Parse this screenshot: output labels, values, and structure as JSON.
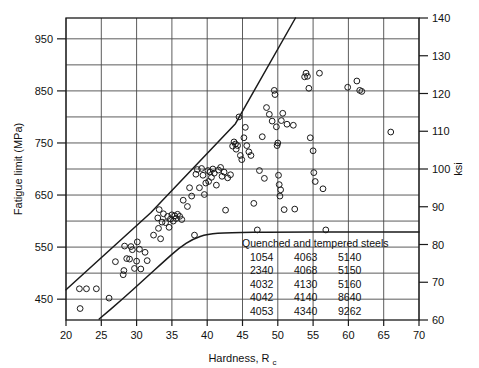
{
  "chart_data": {
    "type": "scatter",
    "title": "",
    "xlabel": "Hardness, Rc",
    "xlabel_main": "Hardness, R",
    "xlabel_sub": "c",
    "ylabel": "Fatigue limit (MPa)",
    "ylabel_right": "ksi",
    "xlim": [
      20,
      70
    ],
    "ylim": [
      410,
      990
    ],
    "ylim_right": [
      60,
      140
    ],
    "grid": true,
    "legend_position": "inside-lower-right",
    "xticks": [
      20,
      25,
      30,
      35,
      40,
      45,
      50,
      55,
      60,
      65,
      70
    ],
    "xtick_labels": [
      "20",
      "25",
      "30",
      "35",
      "40",
      "45",
      "50",
      "55",
      "60",
      "65",
      "70"
    ],
    "yticks": [
      450,
      550,
      650,
      750,
      850,
      950
    ],
    "ytick_labels": [
      "450",
      "550",
      "650",
      "750",
      "850",
      "950"
    ],
    "y_gridlines_mpa": [
      450,
      500,
      550,
      600,
      650,
      700,
      750,
      800,
      850,
      900,
      950
    ],
    "yticks_right": [
      60,
      70,
      80,
      90,
      100,
      110,
      120,
      130,
      140
    ],
    "ytick_labels_right": [
      "60",
      "70",
      "80",
      "90",
      "100",
      "110",
      "120",
      "130",
      "140"
    ],
    "series": [
      {
        "name": "Quenched and tempered steels",
        "marker": "open-circle",
        "color": "#1a1a1a",
        "points": [
          [
            22.0,
            432
          ],
          [
            21.9,
            470
          ],
          [
            22.9,
            470
          ],
          [
            24.3,
            470
          ],
          [
            26.1,
            452
          ],
          [
            27.0,
            522
          ],
          [
            28.1,
            497
          ],
          [
            28.2,
            505
          ],
          [
            28.3,
            552
          ],
          [
            28.6,
            528
          ],
          [
            29.0,
            527
          ],
          [
            29.2,
            551
          ],
          [
            29.4,
            545
          ],
          [
            29.7,
            509
          ],
          [
            30.0,
            523
          ],
          [
            30.1,
            560
          ],
          [
            30.4,
            546
          ],
          [
            30.6,
            508
          ],
          [
            31.2,
            540
          ],
          [
            31.5,
            524
          ],
          [
            32.4,
            573
          ],
          [
            33.0,
            606
          ],
          [
            33.1,
            586
          ],
          [
            33.2,
            622
          ],
          [
            33.4,
            566
          ],
          [
            33.6,
            598
          ],
          [
            33.8,
            614
          ],
          [
            34.1,
            597
          ],
          [
            34.4,
            609
          ],
          [
            34.6,
            588
          ],
          [
            34.8,
            604
          ],
          [
            35.0,
            612
          ],
          [
            35.2,
            600
          ],
          [
            35.4,
            610
          ],
          [
            35.6,
            605
          ],
          [
            35.8,
            613
          ],
          [
            36.1,
            609
          ],
          [
            36.4,
            603
          ],
          [
            36.6,
            640
          ],
          [
            37.2,
            628
          ],
          [
            37.5,
            664
          ],
          [
            37.8,
            648
          ],
          [
            38.2,
            573
          ],
          [
            38.4,
            690
          ],
          [
            38.6,
            699
          ],
          [
            38.9,
            664
          ],
          [
            39.2,
            701
          ],
          [
            39.4,
            688
          ],
          [
            39.6,
            651
          ],
          [
            39.8,
            673
          ],
          [
            40.1,
            697
          ],
          [
            40.2,
            676
          ],
          [
            40.4,
            694
          ],
          [
            40.6,
            684
          ],
          [
            40.8,
            700
          ],
          [
            41.0,
            692
          ],
          [
            41.3,
            669
          ],
          [
            41.6,
            698
          ],
          [
            41.9,
            703
          ],
          [
            42.1,
            686
          ],
          [
            42.4,
            694
          ],
          [
            42.6,
            621
          ],
          [
            42.9,
            683
          ],
          [
            43.3,
            689
          ],
          [
            43.6,
            744
          ],
          [
            43.8,
            752
          ],
          [
            44.0,
            748
          ],
          [
            44.1,
            738
          ],
          [
            44.3,
            745
          ],
          [
            44.5,
            800
          ],
          [
            44.7,
            726
          ],
          [
            44.9,
            718
          ],
          [
            45.2,
            760
          ],
          [
            45.4,
            780
          ],
          [
            45.6,
            745
          ],
          [
            45.9,
            733
          ],
          [
            46.2,
            726
          ],
          [
            46.6,
            634
          ],
          [
            47.1,
            583
          ],
          [
            47.4,
            697
          ],
          [
            47.8,
            762
          ],
          [
            48.1,
            682
          ],
          [
            48.4,
            818
          ],
          [
            48.8,
            805
          ],
          [
            49.2,
            792
          ],
          [
            49.5,
            851
          ],
          [
            49.6,
            843
          ],
          [
            49.8,
            781
          ],
          [
            49.9,
            745
          ],
          [
            50.0,
            750
          ],
          [
            50.1,
            688
          ],
          [
            50.2,
            670
          ],
          [
            50.3,
            648
          ],
          [
            50.4,
            660
          ],
          [
            50.5,
            793
          ],
          [
            50.7,
            807
          ],
          [
            50.9,
            622
          ],
          [
            51.3,
            786
          ],
          [
            52.2,
            784
          ],
          [
            52.4,
            623
          ],
          [
            53.8,
            877
          ],
          [
            54.0,
            884
          ],
          [
            54.2,
            878
          ],
          [
            54.4,
            855
          ],
          [
            54.6,
            760
          ],
          [
            55.0,
            735
          ],
          [
            55.1,
            693
          ],
          [
            55.3,
            676
          ],
          [
            55.9,
            884
          ],
          [
            56.4,
            662
          ],
          [
            56.8,
            583
          ],
          [
            59.9,
            857
          ],
          [
            61.2,
            869
          ],
          [
            61.6,
            851
          ],
          [
            61.9,
            849
          ],
          [
            66.0,
            771
          ]
        ]
      }
    ],
    "boundary_lines": [
      {
        "name": "upper-bound-line",
        "type": "line",
        "points": [
          [
            20.0,
            468
          ],
          [
            32.0,
            616
          ],
          [
            44.0,
            787
          ],
          [
            52.5,
            990
          ]
        ]
      },
      {
        "name": "lower-bound-curve",
        "type": "curve",
        "points": [
          [
            24.7,
            412
          ],
          [
            28.0,
            450
          ],
          [
            31.0,
            487
          ],
          [
            34.0,
            524
          ],
          [
            36.0,
            548
          ],
          [
            38.0,
            566
          ],
          [
            40.0,
            575
          ],
          [
            43.0,
            578
          ],
          [
            50.0,
            579
          ],
          [
            60.0,
            579
          ],
          [
            70.0,
            579
          ]
        ]
      }
    ],
    "legend": {
      "title": "Quenched and tempered steels",
      "columns": [
        [
          "1054",
          "2340",
          "4032",
          "4042",
          "4053"
        ],
        [
          "4063",
          "4068",
          "4130",
          "4140",
          "4340"
        ],
        [
          "5140",
          "5150",
          "5160",
          "8640",
          "9262"
        ]
      ]
    }
  }
}
